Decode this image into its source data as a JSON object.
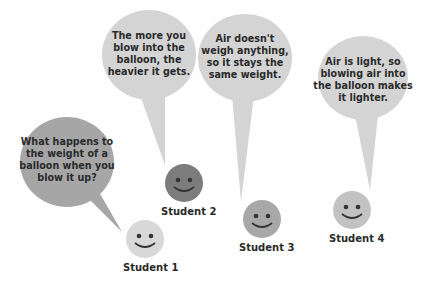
{
  "students": [
    {
      "id": 1,
      "label": "Student 1",
      "speech": "What happens to the weight of a balloon when you blow it up?",
      "speech_lines": [
        "What happens to",
        "the weight of a",
        "balloon when you",
        "blow it up?"
      ],
      "bubble_color": "#a6a6a6",
      "face_color": "#d8d8d8"
    },
    {
      "id": 2,
      "label": "Student 2",
      "speech": "The more you blow into the balloon, the heavier it gets.",
      "speech_lines": [
        "The more you",
        "blow into the",
        "balloon, the",
        "heavier it gets."
      ],
      "bubble_color": "#d4d4d4",
      "face_color": "#7c7c7c"
    },
    {
      "id": 3,
      "label": "Student 3",
      "speech": "Air doesn't weigh anything, so it stays the same weight.",
      "speech_lines": [
        "Air doesn't",
        "weigh anything,",
        "so it stays the",
        "same weight."
      ],
      "bubble_color": "#d4d4d4",
      "face_color": "#a8a8a8"
    },
    {
      "id": 4,
      "label": "Student 4",
      "speech": "Air is light, so blowing air into the balloon makes it lighter.",
      "speech_lines": [
        "Air is light, so",
        "blowing air into",
        "the balloon makes",
        "it lighter."
      ],
      "bubble_color": "#d4d4d4",
      "face_color": "#c2c2c2"
    }
  ]
}
